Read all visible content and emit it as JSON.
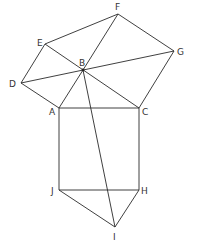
{
  "diagram": {
    "points": {
      "A": {
        "x": 59,
        "y": 108,
        "label": "A",
        "lx": 49,
        "ly": 115
      },
      "B": {
        "x": 83,
        "y": 70,
        "label": "B",
        "lx": 79,
        "ly": 66
      },
      "C": {
        "x": 139,
        "y": 108,
        "label": "C",
        "lx": 142,
        "ly": 115
      },
      "D": {
        "x": 21,
        "y": 83,
        "label": "D",
        "lx": 9,
        "ly": 87
      },
      "E": {
        "x": 45,
        "y": 44,
        "label": "E",
        "lx": 37,
        "ly": 46
      },
      "F": {
        "x": 118,
        "y": 14,
        "label": "F",
        "lx": 115,
        "ly": 10
      },
      "G": {
        "x": 174,
        "y": 51,
        "label": "G",
        "lx": 177,
        "ly": 55
      },
      "H": {
        "x": 139,
        "y": 190,
        "label": "H",
        "lx": 141,
        "ly": 194
      },
      "I": {
        "x": 115,
        "y": 227,
        "label": "I",
        "lx": 113,
        "ly": 240
      },
      "J": {
        "x": 59,
        "y": 190,
        "label": "J",
        "lx": 51,
        "ly": 194
      }
    },
    "segments": [
      [
        "D",
        "E"
      ],
      [
        "E",
        "F"
      ],
      [
        "F",
        "G"
      ],
      [
        "G",
        "C"
      ],
      [
        "C",
        "A"
      ],
      [
        "A",
        "D"
      ],
      [
        "E",
        "C"
      ],
      [
        "D",
        "G"
      ],
      [
        "F",
        "B"
      ],
      [
        "B",
        "A"
      ],
      [
        "B",
        "I"
      ],
      [
        "A",
        "J"
      ],
      [
        "C",
        "H"
      ],
      [
        "J",
        "H"
      ],
      [
        "J",
        "I"
      ],
      [
        "H",
        "I"
      ]
    ]
  }
}
